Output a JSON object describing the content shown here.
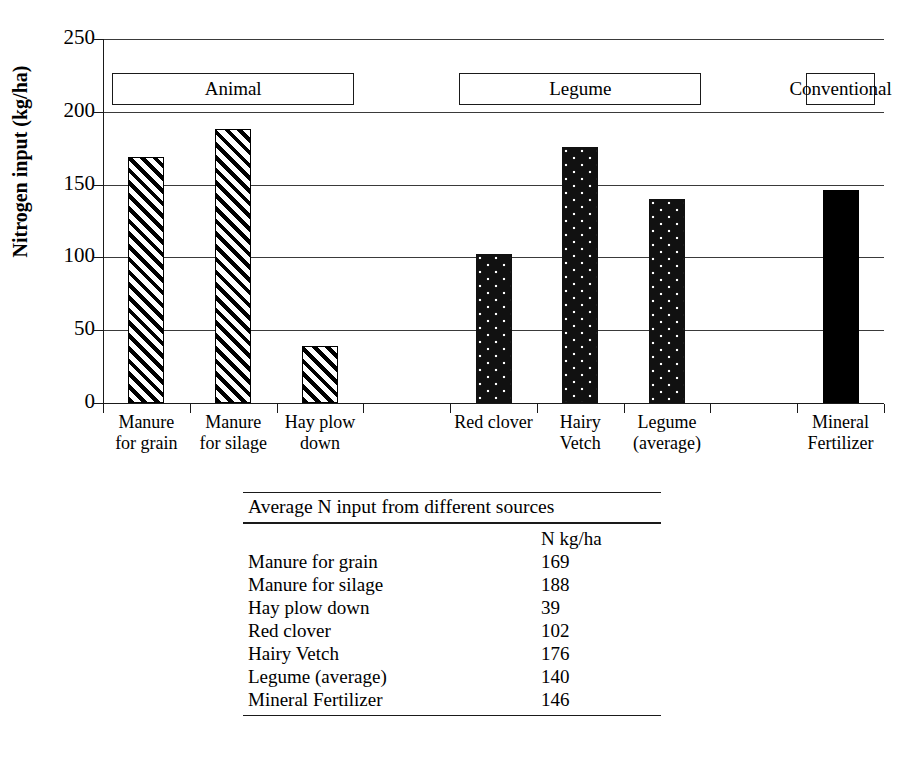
{
  "chart_data": {
    "type": "bar",
    "title": "",
    "xlabel": "",
    "ylabel": "Nitrogen input (kg/ha)",
    "ylim": [
      0,
      250
    ],
    "yticks": [
      0,
      50,
      100,
      150,
      200,
      250
    ],
    "grid": true,
    "legend": "none",
    "categories": [
      "Manure for grain",
      "Manure for silage",
      "Hay plow down",
      "Red clover",
      "Hairy Vetch",
      "Legume (average)",
      "Mineral Fertilizer"
    ],
    "values": [
      169,
      188,
      39,
      102,
      176,
      140,
      146
    ],
    "bars": [
      {
        "label_line1": "Manure",
        "label_line2": "for grain",
        "value": 169,
        "fill": "hatch",
        "slot": 0
      },
      {
        "label_line1": "Manure",
        "label_line2": "for silage",
        "value": 188,
        "fill": "hatch",
        "slot": 1
      },
      {
        "label_line1": "Hay plow",
        "label_line2": "down",
        "value": 39,
        "fill": "hatch",
        "slot": 2
      },
      {
        "label_line1": "Red clover",
        "label_line2": "",
        "value": 102,
        "fill": "dots",
        "slot": 4
      },
      {
        "label_line1": "Hairy",
        "label_line2": "Vetch",
        "value": 176,
        "fill": "dots",
        "slot": 5
      },
      {
        "label_line1": "Legume",
        "label_line2": "(average)",
        "value": 140,
        "fill": "dots",
        "slot": 6
      },
      {
        "label_line1": "Mineral",
        "label_line2": "Fertilizer",
        "value": 146,
        "fill": "solid",
        "slot": 8
      }
    ],
    "groups": [
      {
        "label": "Animal",
        "start_slot": 0,
        "end_slot": 2
      },
      {
        "label": "Legume",
        "start_slot": 4,
        "end_slot": 6
      },
      {
        "label": "Conventional",
        "start_slot": 8,
        "end_slot": 8
      }
    ]
  },
  "table": {
    "title": "Average N input from different sources",
    "unit_header": "N kg/ha",
    "rows": [
      {
        "name": "Manure for grain",
        "value": "169"
      },
      {
        "name": "Manure for silage",
        "value": "188"
      },
      {
        "name": "Hay plow down",
        "value": "39"
      },
      {
        "name": "Red clover",
        "value": "102"
      },
      {
        "name": "Hairy Vetch",
        "value": "176"
      },
      {
        "name": "Legume (average)",
        "value": "140"
      },
      {
        "name": "Mineral Fertilizer",
        "value": "146"
      }
    ]
  },
  "colors": {
    "ink": "#000000",
    "gridline": "#3a3a3a",
    "background": "#ffffff"
  }
}
